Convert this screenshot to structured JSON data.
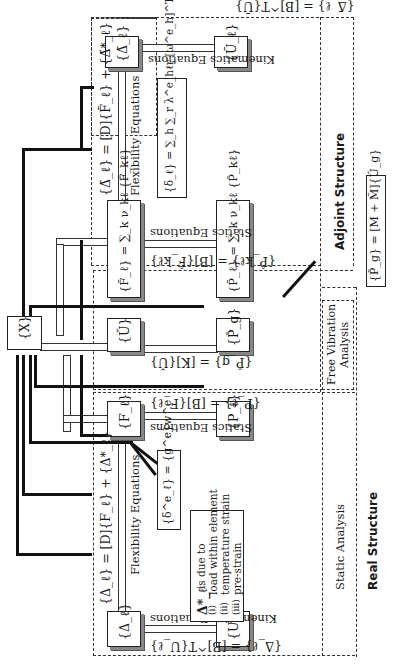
{
  "diagram": {
    "orientation": "rotated 90deg, text reads bottom-to-top",
    "regions": {
      "adjoint_structure": "Adjoint Structure",
      "real_structure": "Real Structure",
      "static_analysis": "Static Analysis",
      "free_vibration_analysis_line1": "Free Vibration",
      "free_vibration_analysis_line2": "Analysis"
    },
    "nodes": {
      "x": "{X}",
      "u_bar": "{Ū_ℓ}",
      "delta_bar": "{Δ̄_ℓ}",
      "f_bar": "{F̄_ℓ} = ∑_k ν_kℓ {F̂_kℓ}",
      "p_bar": "{P̄_ℓ} = ∑_k ν_kℓ {P̂_kℓ}",
      "u_check": "{Ǔ}",
      "p_check": "{P̌_g}",
      "f_l": "{F_ℓ}",
      "p_l": "{P_ℓ}",
      "delta_l": "{Δ_ℓ}",
      "u_l": "{U_ℓ}",
      "pg_mass": "{P̌_g} = [M + M̃]{Ǔ_g}"
    },
    "equations": {
      "adjoint_kinematics": "{Δ̄_ℓ} = [B]^T{Ū}",
      "adjoint_kinematics_label": "Kinematics Equations",
      "adjoint_flexibility": "{Δ̄_ℓ} = [D]{F̄_ℓ} + {Δ̄*_ℓ}",
      "adjoint_flexibility_label": "Flexibility Equations",
      "delta_sum": "{δ_ℓ} = ∑_h ∑_r λ^e_hℓr [ω^e_h]^T {s^e_hr}",
      "adjoint_statics": "{P̂_kℓ} = [B]{F̂_kℓ}",
      "adjoint_statics_label": "Statics Equations",
      "free_vib": "{P̌_g} = [K]{Ǔ}",
      "real_statics": "{P_ℓ} = [B]{F_ℓ}",
      "real_statics_label": "Statics Equations",
      "real_flexibility": "{Δ_ℓ} = [D]{F_ℓ} + {Δ*_ℓ}",
      "real_flexibility_label": "Flexibility Equations",
      "delta_e": "{δ^e_ℓ} = {g^e}w^e",
      "real_kinematics": "{Δ_ℓ} = [B]^T{U_ℓ}",
      "real_kinematics_label": "Kinematics Equations"
    },
    "note": {
      "head": "Δ*_ℓ",
      "line0": "is due to",
      "items": [
        {
          "num": "(i)",
          "text": "load within element"
        },
        {
          "num": "(ii)",
          "text": "temperature strain"
        },
        {
          "num": "(iii)",
          "text": "pre-strain"
        }
      ]
    }
  }
}
